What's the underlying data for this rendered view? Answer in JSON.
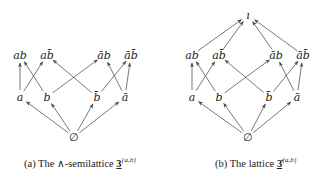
{
  "figure_a": {
    "caption_prefix": "(a) The ∧-semilattice ",
    "caption_symbol": "3",
    "caption_superscript": "{a,b}",
    "nodes": [
      {
        "id": "ab",
        "label": "ab",
        "x": 20,
        "y": 55
      },
      {
        "id": "abbar",
        "label": "ab̄",
        "x": 47,
        "y": 55
      },
      {
        "id": "abarb",
        "label": "āb",
        "x": 104,
        "y": 55
      },
      {
        "id": "abarbbar",
        "label": "āb̄",
        "x": 131,
        "y": 55
      },
      {
        "id": "a",
        "label": "a",
        "x": 20,
        "y": 97
      },
      {
        "id": "b",
        "label": "b",
        "x": 47,
        "y": 97
      },
      {
        "id": "bbar",
        "label": "b̄",
        "x": 97,
        "y": 97
      },
      {
        "id": "abar",
        "label": "ā",
        "x": 125,
        "y": 97
      },
      {
        "id": "empty",
        "label": "∅",
        "x": 74,
        "y": 137
      }
    ],
    "edges": [
      [
        "empty",
        "a"
      ],
      [
        "empty",
        "b"
      ],
      [
        "empty",
        "bbar"
      ],
      [
        "empty",
        "abar"
      ],
      [
        "a",
        "ab"
      ],
      [
        "a",
        "abbar"
      ],
      [
        "b",
        "ab"
      ],
      [
        "b",
        "abarb"
      ],
      [
        "bbar",
        "abbar"
      ],
      [
        "bbar",
        "abarbbar"
      ],
      [
        "abar",
        "abarb"
      ],
      [
        "abar",
        "abarbbar"
      ]
    ]
  },
  "figure_b": {
    "caption_prefix": "(b) The lattice ",
    "caption_symbol": "3̇",
    "caption_superscript": "{a,b}",
    "nodes": [
      {
        "id": "top",
        "label": "ı",
        "x": 248,
        "y": 15
      },
      {
        "id": "ab",
        "label": "ab",
        "x": 192,
        "y": 55
      },
      {
        "id": "abbar",
        "label": "ab̄",
        "x": 219,
        "y": 55
      },
      {
        "id": "abarb",
        "label": "āb",
        "x": 276,
        "y": 55
      },
      {
        "id": "abarbbar",
        "label": "āb̄",
        "x": 303,
        "y": 55
      },
      {
        "id": "a",
        "label": "a",
        "x": 192,
        "y": 97
      },
      {
        "id": "b",
        "label": "b",
        "x": 219,
        "y": 97
      },
      {
        "id": "bbar",
        "label": "b̄",
        "x": 269,
        "y": 97
      },
      {
        "id": "abar",
        "label": "ā",
        "x": 297,
        "y": 97
      },
      {
        "id": "empty",
        "label": "∅",
        "x": 248,
        "y": 137
      }
    ],
    "edges": [
      [
        "empty",
        "a"
      ],
      [
        "empty",
        "b"
      ],
      [
        "empty",
        "bbar"
      ],
      [
        "empty",
        "abar"
      ],
      [
        "a",
        "ab"
      ],
      [
        "a",
        "abbar"
      ],
      [
        "b",
        "ab"
      ],
      [
        "b",
        "abarb"
      ],
      [
        "bbar",
        "abbar"
      ],
      [
        "bbar",
        "abarbbar"
      ],
      [
        "abar",
        "abarb"
      ],
      [
        "abar",
        "abarbbar"
      ],
      [
        "ab",
        "top"
      ],
      [
        "abbar",
        "top"
      ],
      [
        "abarb",
        "top"
      ],
      [
        "abarbbar",
        "top"
      ]
    ]
  }
}
